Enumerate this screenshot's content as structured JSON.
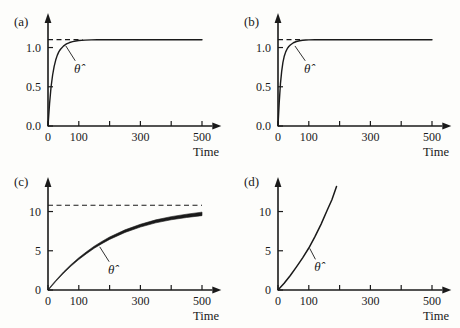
{
  "figure": {
    "background_color": "#fdfdfb",
    "ink_color": "#1a1a1a",
    "panel_count": 4
  },
  "chart_data": [
    {
      "type": "line",
      "panel": "(a)",
      "title": "",
      "xlabel": "Time",
      "ylabel": "",
      "xlim": [
        0,
        540
      ],
      "ylim": [
        0,
        1.3
      ],
      "xticks": [
        0,
        100,
        200,
        300,
        400,
        500
      ],
      "xticklabels": [
        "0",
        "100",
        "",
        "300",
        "",
        "500"
      ],
      "yticks": [
        0.0,
        0.5,
        1.0
      ],
      "yticklabels": [
        "0.0",
        "0.5",
        "1.0"
      ],
      "grid": false,
      "legend": "none",
      "annotations": [
        {
          "text": "θ̂",
          "x": 95,
          "y": 0.78,
          "leader_to_x": 58,
          "leader_to_y": 1.02
        }
      ],
      "reference_line": {
        "style": "dashed",
        "value": 1.1,
        "x_start": 0,
        "x_end": 112,
        "label": "true parameter"
      },
      "series": [
        {
          "name": "theta-hat",
          "style": "solid",
          "linewidth": 1.4,
          "x": [
            0,
            5,
            10,
            15,
            20,
            25,
            30,
            35,
            40,
            50,
            60,
            70,
            80,
            90,
            100,
            120,
            140,
            160,
            200,
            250,
            300,
            350,
            400,
            450,
            500
          ],
          "y": [
            0.0,
            0.28,
            0.5,
            0.65,
            0.76,
            0.84,
            0.9,
            0.945,
            0.975,
            1.018,
            1.046,
            1.064,
            1.076,
            1.084,
            1.089,
            1.095,
            1.098,
            1.099,
            1.1,
            1.1,
            1.1,
            1.1,
            1.1,
            1.1,
            1.1
          ]
        }
      ]
    },
    {
      "type": "line",
      "panel": "(b)",
      "title": "",
      "xlabel": "Time",
      "ylabel": "",
      "xlim": [
        0,
        540
      ],
      "ylim": [
        0,
        1.3
      ],
      "xticks": [
        0,
        100,
        200,
        300,
        400,
        500
      ],
      "xticklabels": [
        "0",
        "100",
        "",
        "300",
        "",
        "500"
      ],
      "yticks": [
        0.0,
        0.5,
        1.0
      ],
      "yticklabels": [
        "0.0",
        "0.5",
        "1.0"
      ],
      "grid": false,
      "legend": "none",
      "annotations": [
        {
          "text": "θ̂",
          "x": 95,
          "y": 0.78,
          "leader_to_x": 55,
          "leader_to_y": 1.02
        }
      ],
      "reference_line": {
        "style": "dashed",
        "value": 1.1,
        "x_start": 0,
        "x_end": 78,
        "label": "true parameter"
      },
      "series": [
        {
          "name": "theta-hat",
          "style": "solid",
          "linewidth": 1.4,
          "x": [
            0,
            4,
            8,
            12,
            16,
            20,
            25,
            30,
            35,
            40,
            50,
            60,
            70,
            80,
            90,
            100,
            120,
            150,
            200,
            250,
            300,
            350,
            400,
            450,
            500
          ],
          "y": [
            0.0,
            0.3,
            0.54,
            0.7,
            0.81,
            0.885,
            0.945,
            0.985,
            1.013,
            1.033,
            1.061,
            1.077,
            1.087,
            1.093,
            1.096,
            1.098,
            1.1,
            1.1,
            1.1,
            1.1,
            1.1,
            1.1,
            1.1,
            1.1,
            1.1
          ]
        }
      ]
    },
    {
      "type": "line",
      "panel": "(c)",
      "title": "",
      "xlabel": "Time",
      "ylabel": "",
      "xlim": [
        0,
        540
      ],
      "ylim": [
        0,
        13
      ],
      "xticks": [
        0,
        100,
        200,
        300,
        400,
        500
      ],
      "xticklabels": [
        "0",
        "100",
        "",
        "300",
        "",
        "500"
      ],
      "yticks": [
        0,
        5,
        10
      ],
      "yticklabels": [
        "0",
        "5",
        "10"
      ],
      "grid": false,
      "legend": "none",
      "annotations": [
        {
          "text": "θ̂",
          "x": 205,
          "y": 3.1,
          "leader_to_x": 168,
          "leader_to_y": 5.5
        }
      ],
      "reference_line": {
        "style": "dashed",
        "value": 10.8,
        "x_start": 0,
        "x_end": 500,
        "label": "true parameter"
      },
      "series": [
        {
          "name": "theta-hat",
          "style": "solid-band",
          "linewidth": 2.2,
          "x": [
            0,
            25,
            50,
            75,
            100,
            125,
            150,
            175,
            200,
            250,
            300,
            350,
            400,
            450,
            500
          ],
          "y": [
            0.0,
            1.15,
            2.2,
            3.15,
            4.0,
            4.75,
            5.45,
            6.05,
            6.6,
            7.5,
            8.2,
            8.75,
            9.15,
            9.45,
            9.7
          ],
          "band_width_start": 1.0,
          "band_width_end": 3.5
        }
      ]
    },
    {
      "type": "line",
      "panel": "(d)",
      "title": "",
      "xlabel": "Time",
      "ylabel": "",
      "xlim": [
        0,
        540
      ],
      "ylim": [
        0,
        13
      ],
      "xticks": [
        0,
        100,
        200,
        300,
        400,
        500
      ],
      "xticklabels": [
        "0",
        "100",
        "",
        "300",
        "",
        "500"
      ],
      "yticks": [
        0,
        5,
        10
      ],
      "yticklabels": [
        "0",
        "5",
        "10"
      ],
      "grid": false,
      "legend": "none",
      "annotations": [
        {
          "text": "θ̂",
          "x": 128,
          "y": 3.4,
          "leader_to_x": 103,
          "leader_to_y": 5.3
        }
      ],
      "reference_line": null,
      "series": [
        {
          "name": "theta-hat",
          "style": "solid",
          "linewidth": 1.5,
          "x": [
            0,
            20,
            40,
            60,
            80,
            100,
            120,
            140,
            160,
            175,
            190
          ],
          "y": [
            0.0,
            0.85,
            1.85,
            2.95,
            4.1,
            5.35,
            6.8,
            8.4,
            10.2,
            11.5,
            13.2
          ]
        }
      ]
    }
  ]
}
